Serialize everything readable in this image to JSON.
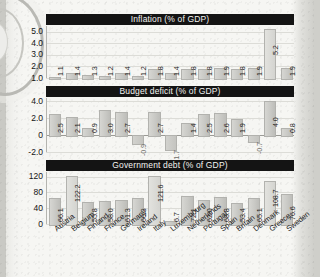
{
  "page": {
    "background_color": "#f6f6f3",
    "bar_color": "#c9c9c5",
    "title_bar_color": "#141414",
    "title_text_color": "#f3f3f0"
  },
  "categories": [
    "Austria",
    "Belgium",
    "Finland",
    "France",
    "Germany",
    "Ireland",
    "Italy",
    "Luxembourg",
    "Netherlands",
    "Portugal",
    "Spain",
    "Britain",
    "Denmark",
    "Greece",
    "Sweden"
  ],
  "charts": [
    {
      "id": "inflation",
      "title": "Inflation (% of GDP)",
      "yticks": [
        "5.0",
        "4.0",
        "3.0",
        "2.0",
        "1.0"
      ],
      "ytick_values": [
        5,
        4,
        3,
        2,
        1
      ],
      "ymin": 1.0,
      "ymax": 5.5,
      "values": [
        1.1,
        1.4,
        1.3,
        1.2,
        1.4,
        1.2,
        1.8,
        1.4,
        1.8,
        1.8,
        1.9,
        1.8,
        1.9,
        5.2,
        1.9
      ],
      "labels": [
        "1.1",
        "1.4",
        "1.3",
        "1.2",
        "1.4",
        "1.2",
        "1.8",
        "1.4",
        "1.8",
        "1.8",
        "1.9",
        "1.8",
        "1.9",
        "5.2",
        "1.9"
      ]
    },
    {
      "id": "budget-deficit",
      "title": "Budget deficit (% of GDP)",
      "yticks": [
        "4.0",
        "2.0",
        "0",
        "-2.0"
      ],
      "ytick_values": [
        4,
        2,
        0,
        -2
      ],
      "ymin": -2.0,
      "ymax": 4.4,
      "values": [
        2.5,
        2.1,
        0.9,
        3.0,
        2.7,
        -0.9,
        2.7,
        -1.7,
        1.4,
        2.5,
        2.6,
        1.9,
        -0.7,
        4.0,
        0.8
      ],
      "labels": [
        "2.5",
        "2.1",
        "0.9",
        "3.0",
        "2.7",
        "-0.9",
        "2.7",
        "-1.7",
        "1.4",
        "2.5",
        "2.6",
        "1.9",
        "-0.7",
        "4.0",
        "0.8"
      ]
    },
    {
      "id": "government-debt",
      "title": "Government debt (% of GDP)",
      "yticks": [
        "120",
        "80",
        "40",
        "0"
      ],
      "ytick_values": [
        120,
        80,
        40,
        0
      ],
      "ymin": 0,
      "ymax": 132,
      "values": [
        66.1,
        122.2,
        55.8,
        58.0,
        61.3,
        66.3,
        121.6,
        6.7,
        72.1,
        62.0,
        68.8,
        53.4,
        65.1,
        108.7,
        76.6
      ],
      "labels": [
        "66.1",
        "122.2",
        "55.8",
        "58.0",
        "61.3",
        "66.3",
        "121.6",
        "6.7",
        "72.1",
        "62.0",
        "68.8",
        "53.4",
        "65.1",
        "108.7",
        "76.6"
      ]
    }
  ],
  "chart_data": [
    {
      "type": "bar",
      "title": "Inflation (% of GDP)",
      "xlabel": "",
      "ylabel": "",
      "ylim": [
        1.0,
        5.5
      ],
      "grid": true,
      "legend": "none",
      "categories": [
        "Austria",
        "Belgium",
        "Finland",
        "France",
        "Germany",
        "Ireland",
        "Italy",
        "Luxembourg",
        "Netherlands",
        "Portugal",
        "Spain",
        "Britain",
        "Denmark",
        "Greece",
        "Sweden"
      ],
      "values": [
        1.1,
        1.4,
        1.3,
        1.2,
        1.4,
        1.2,
        1.8,
        1.4,
        1.8,
        1.8,
        1.9,
        1.8,
        1.9,
        5.2,
        1.9
      ],
      "tick_labels": [
        "5.0",
        "4.0",
        "3.0",
        "2.0",
        "1.0"
      ]
    },
    {
      "type": "bar",
      "title": "Budget deficit (% of GDP)",
      "xlabel": "",
      "ylabel": "",
      "ylim": [
        -2.0,
        4.4
      ],
      "grid": true,
      "legend": "none",
      "categories": [
        "Austria",
        "Belgium",
        "Finland",
        "France",
        "Germany",
        "Ireland",
        "Italy",
        "Luxembourg",
        "Netherlands",
        "Portugal",
        "Spain",
        "Britain",
        "Denmark",
        "Greece",
        "Sweden"
      ],
      "values": [
        2.5,
        2.1,
        0.9,
        3.0,
        2.7,
        -0.9,
        2.7,
        -1.7,
        1.4,
        2.5,
        2.6,
        1.9,
        -0.7,
        4.0,
        0.8
      ],
      "tick_labels": [
        "4.0",
        "2.0",
        "0",
        "-2.0"
      ]
    },
    {
      "type": "bar",
      "title": "Government debt (% of GDP)",
      "xlabel": "",
      "ylabel": "",
      "ylim": [
        0,
        132
      ],
      "grid": true,
      "legend": "none",
      "categories": [
        "Austria",
        "Belgium",
        "Finland",
        "France",
        "Germany",
        "Ireland",
        "Italy",
        "Luxembourg",
        "Netherlands",
        "Portugal",
        "Spain",
        "Britain",
        "Denmark",
        "Greece",
        "Sweden"
      ],
      "values": [
        66.1,
        122.2,
        55.8,
        58.0,
        61.3,
        66.3,
        121.6,
        6.7,
        72.1,
        62.0,
        68.8,
        53.4,
        65.1,
        108.7,
        76.6
      ],
      "tick_labels": [
        "120",
        "80",
        "40",
        "0"
      ]
    }
  ]
}
